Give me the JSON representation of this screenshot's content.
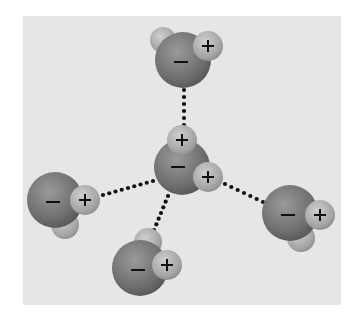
{
  "diagram": {
    "colors": {
      "background": "#e6e6e6",
      "oxygen": "#7a7a7a",
      "hydrogen": "#b0b0b0",
      "bond": "#111111"
    },
    "charge_labels": {
      "negative": "−",
      "positive": "+"
    },
    "molecules": [
      {
        "id": "top",
        "oxygen": {
          "x": 183,
          "y": 60,
          "r": 28
        },
        "hydrogens": [
          {
            "x": 163,
            "y": 40,
            "r": 13,
            "label": ""
          },
          {
            "x": 208,
            "y": 46,
            "r": 15,
            "label": "+"
          }
        ],
        "o_label": "−"
      },
      {
        "id": "center",
        "oxygen": {
          "x": 182,
          "y": 167,
          "r": 28
        },
        "hydrogens": [
          {
            "x": 182,
            "y": 140,
            "r": 15,
            "label": "+"
          },
          {
            "x": 208,
            "y": 177,
            "r": 15,
            "label": "+"
          }
        ],
        "o_label": "−"
      },
      {
        "id": "left",
        "oxygen": {
          "x": 55,
          "y": 200,
          "r": 28
        },
        "hydrogens": [
          {
            "x": 65,
            "y": 225,
            "r": 14,
            "label": ""
          },
          {
            "x": 85,
            "y": 200,
            "r": 15,
            "label": "+"
          }
        ],
        "o_label": "−"
      },
      {
        "id": "right",
        "oxygen": {
          "x": 290,
          "y": 213,
          "r": 28
        },
        "hydrogens": [
          {
            "x": 301,
            "y": 238,
            "r": 14,
            "label": ""
          },
          {
            "x": 320,
            "y": 215,
            "r": 15,
            "label": "+"
          }
        ],
        "o_label": "−"
      },
      {
        "id": "bottom",
        "oxygen": {
          "x": 140,
          "y": 268,
          "r": 28
        },
        "hydrogens": [
          {
            "x": 148,
            "y": 242,
            "r": 14,
            "label": ""
          },
          {
            "x": 167,
            "y": 265,
            "r": 15,
            "label": "+"
          }
        ],
        "o_label": "−"
      }
    ],
    "hydrogen_bonds": [
      {
        "from": "top",
        "to": "center",
        "x1": 184,
        "y1": 90,
        "x2": 184,
        "y2": 125
      },
      {
        "from": "left",
        "to": "center",
        "x1": 103,
        "y1": 195,
        "x2": 153,
        "y2": 181
      },
      {
        "from": "center",
        "to": "right",
        "x1": 225,
        "y1": 184,
        "x2": 263,
        "y2": 202
      },
      {
        "from": "center",
        "to": "bottom",
        "x1": 168,
        "y1": 196,
        "x2": 154,
        "y2": 230
      }
    ]
  }
}
